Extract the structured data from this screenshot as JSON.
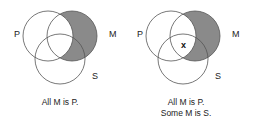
{
  "diagrams": [
    {
      "labels": {
        "p": "P",
        "m": "M",
        "s": "S"
      },
      "caption": [
        "All M is P."
      ],
      "mark": ""
    },
    {
      "labels": {
        "p": "P",
        "m": "M",
        "s": "S"
      },
      "caption": [
        "All M is P.",
        "Some M is S."
      ],
      "mark": "x"
    }
  ],
  "colors": {
    "shade": "#8a8a8a",
    "stroke": "#555555",
    "text": "#222222"
  }
}
